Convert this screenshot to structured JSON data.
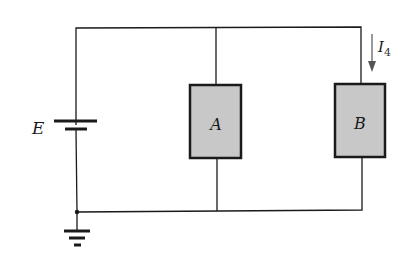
{
  "diagram": {
    "type": "parallel-circuit",
    "source": {
      "label": "E",
      "kind": "battery"
    },
    "ground": {
      "kind": "ground-symbol"
    },
    "loads": [
      {
        "label": "A",
        "fill": "#c8c8c8"
      },
      {
        "label": "B",
        "fill": "#c8c8c8"
      }
    ],
    "current": {
      "symbol": "I",
      "subscript": "4",
      "direction": "down",
      "branch": "B"
    },
    "colors": {
      "wire": "#1a1a1a",
      "box_fill": "#c8c8c8",
      "arrow": "#555555"
    }
  }
}
